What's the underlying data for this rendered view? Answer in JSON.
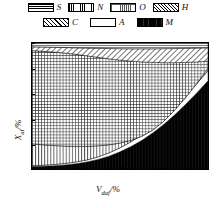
{
  "legend": {
    "rows": [
      [
        {
          "key": "S",
          "label": "S",
          "pattern": "horizontal-lines"
        },
        {
          "key": "N",
          "label": "N",
          "pattern": "vertical-lines"
        },
        {
          "key": "O",
          "label": "O",
          "pattern": "cross-hatch-grid"
        },
        {
          "key": "H",
          "label": "H",
          "pattern": "diagonal-hatch-fine"
        }
      ],
      [
        {
          "key": "C",
          "label": "C",
          "pattern": "diagonal-hatch-coarse"
        },
        {
          "key": "A",
          "label": "A",
          "pattern": "blank-white"
        },
        {
          "key": "M",
          "label": "M",
          "pattern": "solid-black"
        }
      ]
    ]
  },
  "chart_data": {
    "type": "area",
    "title": "",
    "xlabel": "V_daf/%",
    "ylabel": "X_ai/%",
    "xlabel_base": "V",
    "xlabel_sub": "daf",
    "xlabel_unit": "/%",
    "ylabel_base": "X",
    "ylabel_sub": "ai",
    "ylabel_unit": "/%",
    "xlim": [
      0,
      80
    ],
    "ylim": [
      0,
      100
    ],
    "xticks": [
      10,
      20,
      30,
      40,
      50,
      60,
      70
    ],
    "yticks": [
      0,
      20,
      40,
      60,
      80,
      100
    ],
    "xticklabels": [
      "10",
      "20",
      "30",
      "40",
      "50",
      "60",
      "70"
    ],
    "yticklabels": [
      "0",
      "20",
      "40",
      "60",
      "80",
      "100"
    ],
    "grid": false,
    "legend_position": "above-plot",
    "series": [
      {
        "name": "M",
        "label": "M",
        "pattern": "solid-black",
        "description": "moisture band rising from bottom-left to upper-right",
        "x": [
          0,
          5,
          10,
          15,
          20,
          25,
          30,
          35,
          40,
          45,
          50,
          55,
          60,
          65,
          70,
          75,
          80
        ],
        "y_lower": [
          0,
          0,
          0,
          0,
          0,
          0,
          0,
          0,
          0,
          0,
          0,
          0,
          0,
          0,
          0,
          0,
          0
        ],
        "y_upper": [
          2.0,
          2.2,
          2.6,
          3.2,
          4.2,
          5.6,
          7.6,
          10.2,
          13.6,
          17.8,
          22.8,
          28.8,
          35.6,
          43.2,
          51.6,
          60.6,
          70.0
        ]
      },
      {
        "name": "A",
        "label": "A",
        "pattern": "blank-white",
        "description": "ash wedge between M curve and N band, widening to the right",
        "x": [
          0,
          5,
          10,
          15,
          20,
          25,
          30,
          35,
          40,
          45,
          50,
          55,
          60,
          65,
          70,
          75,
          80
        ],
        "y_lower": [
          2.0,
          2.2,
          2.6,
          3.2,
          4.2,
          5.6,
          7.6,
          10.2,
          13.6,
          17.8,
          22.8,
          28.8,
          35.6,
          43.2,
          51.6,
          60.6,
          70.0
        ],
        "y_upper": [
          2.6,
          3.0,
          3.6,
          4.4,
          5.6,
          7.2,
          9.6,
          12.8,
          16.8,
          21.6,
          27.2,
          33.8,
          41.2,
          49.4,
          58.4,
          68.0,
          78.0
        ]
      },
      {
        "name": "N",
        "label": "N",
        "pattern": "vertical-lines",
        "description": "lower vertical-line band from the A wedge up to ~20% at left",
        "x": [
          0,
          5,
          10,
          15,
          20,
          25,
          30,
          35,
          40,
          45,
          50,
          55,
          60,
          65,
          70,
          75,
          80
        ],
        "y_lower": [
          2.6,
          3.0,
          3.6,
          4.4,
          5.6,
          7.2,
          9.6,
          12.8,
          16.8,
          21.6,
          27.2,
          33.8,
          41.2,
          49.4,
          58.4,
          68.0,
          78.0
        ],
        "y_upper": [
          20.0,
          19.2,
          18.6,
          18.2,
          18.0,
          18.0,
          18.4,
          19.2,
          20.6,
          22.8,
          26.0,
          31.0,
          38.0,
          47.0,
          57.0,
          68.0,
          80.0
        ]
      },
      {
        "name": "O",
        "label": "O",
        "pattern": "cross-hatch-grid",
        "description": "large oxygen cross-hatch field filling the central plot area",
        "x": [
          0,
          5,
          10,
          15,
          20,
          25,
          30,
          35,
          40,
          45,
          50,
          55,
          60,
          65,
          70,
          75,
          80
        ],
        "y_lower": [
          20.0,
          19.2,
          18.6,
          18.2,
          18.0,
          18.0,
          18.4,
          19.2,
          20.6,
          22.8,
          26.0,
          31.0,
          38.0,
          47.0,
          57.0,
          68.0,
          80.0
        ],
        "y_upper": [
          94.0,
          93.4,
          92.8,
          92.0,
          91.0,
          89.8,
          88.6,
          87.4,
          86.4,
          85.6,
          85.0,
          84.6,
          84.4,
          84.4,
          84.6,
          85.0,
          85.6
        ]
      },
      {
        "name": "H",
        "label": "H",
        "pattern": "diagonal-hatch-fine",
        "description": "thin hydrogen band near the top of the plot",
        "x": [
          0,
          5,
          10,
          15,
          20,
          25,
          30,
          35,
          40,
          45,
          50,
          55,
          60,
          65,
          70,
          75,
          80
        ],
        "y_lower": [
          94.0,
          93.4,
          92.8,
          92.0,
          91.0,
          89.8,
          88.6,
          87.4,
          86.4,
          85.6,
          85.0,
          84.6,
          84.4,
          84.4,
          84.6,
          85.0,
          85.6
        ],
        "y_upper": [
          97.0,
          96.8,
          96.6,
          96.4,
          96.2,
          96.0,
          95.8,
          95.6,
          95.5,
          95.4,
          95.4,
          95.4,
          95.5,
          95.6,
          95.8,
          96.0,
          96.2
        ]
      },
      {
        "name": "S",
        "label": "S",
        "pattern": "horizontal-lines",
        "description": "very thin sulphur band at the very top of the plot",
        "x": [
          0,
          5,
          10,
          15,
          20,
          25,
          30,
          35,
          40,
          45,
          50,
          55,
          60,
          65,
          70,
          75,
          80
        ],
        "y_lower": [
          97.0,
          96.8,
          96.6,
          96.4,
          96.2,
          96.0,
          95.8,
          95.6,
          95.5,
          95.4,
          95.4,
          95.4,
          95.5,
          95.6,
          95.8,
          96.0,
          96.2
        ],
        "y_upper": [
          100,
          100,
          100,
          100,
          100,
          100,
          100,
          100,
          100,
          100,
          100,
          100,
          100,
          100,
          100,
          100,
          100
        ]
      }
    ]
  }
}
